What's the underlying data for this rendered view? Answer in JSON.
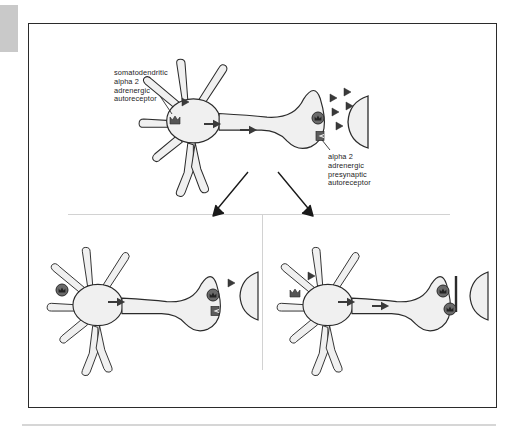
{
  "figure": {
    "labels": {
      "somatodendritic": "somatodendritic\nalpha 2\nadrenergic\nautoreceptor",
      "presynaptic": "alpha 2\nadrenergic\npresynaptic\nautoreceptor"
    },
    "colors": {
      "frame": "#2b2b2b",
      "neuron_fill": "#f0f0f0",
      "neuron_stroke": "#2b2b2b",
      "receptor_dark": "#4a4a4a",
      "receptor_occupied": "#5a5a5a",
      "neurotransmitter": "#3a3a3a",
      "divider": "#d2d2d2",
      "page_tab": "#c9c9c9",
      "bottom_rule": "#d6d6d6"
    },
    "panels": [
      {
        "id": "top",
        "name": "baseline-neuron",
        "position": "top-center",
        "somatodendritic_receptor_state": "unoccupied",
        "presynaptic_receptor_state": "unoccupied",
        "neurotransmitter_count_in_cleft": 5,
        "neurotransmitter_count_at_soma": 1,
        "impulse_arrows": 2
      },
      {
        "id": "bottom-left",
        "name": "somatodendritic-autoreceptor-occupied",
        "position": "bottom-left",
        "somatodendritic_receptor_state": "occupied",
        "presynaptic_receptor_state": "unoccupied",
        "neurotransmitter_count_in_cleft": 1,
        "neurotransmitter_count_at_soma": 0,
        "impulse_arrows": 1
      },
      {
        "id": "bottom-right",
        "name": "presynaptic-autoreceptor-occupied",
        "position": "bottom-right",
        "somatodendritic_receptor_state": "unoccupied",
        "presynaptic_receptor_state": "occupied",
        "neurotransmitter_count_in_cleft": 0,
        "neurotransmitter_count_at_soma": 1,
        "impulse_arrows": 2
      }
    ],
    "flow_arrows": [
      {
        "name": "arrow-to-bottom-left",
        "from": [
          248,
          172
        ],
        "to": [
          212,
          216
        ]
      },
      {
        "name": "arrow-to-bottom-right",
        "from": [
          278,
          172
        ],
        "to": [
          314,
          216
        ]
      }
    ]
  }
}
